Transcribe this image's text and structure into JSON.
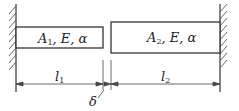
{
  "diagram": {
    "bar1": {
      "label": "A",
      "sub": "1",
      "props": ", E, α"
    },
    "bar2": {
      "label": "A",
      "sub": "2",
      "props": ", E, α"
    },
    "dim1": {
      "label": "l",
      "sub": "1"
    },
    "dim2": {
      "label": "l",
      "sub": "2"
    },
    "gap": {
      "label": "δ"
    },
    "colors": {
      "line": "#333333",
      "background": "#ffffff"
    }
  }
}
